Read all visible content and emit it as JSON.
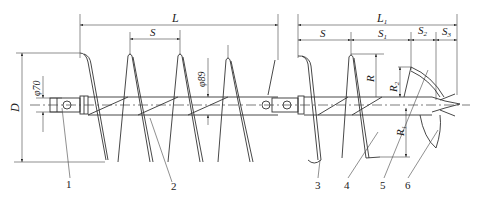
{
  "diagram": {
    "dimensions": {
      "L": "L",
      "L1": "L",
      "L1_sub": "1",
      "S": "S",
      "S_right": "S",
      "S1": "S",
      "S1_sub": "1",
      "S2": "S",
      "S2_sub": "2",
      "S3": "S",
      "S3_sub": "3",
      "D": "D",
      "R": "R",
      "R1": "R",
      "R1_sub": "1",
      "R2": "R",
      "R2_sub": "2",
      "phi70": "φ70",
      "phi89": "φ89"
    },
    "part_labels": [
      "1",
      "2",
      "3",
      "4",
      "5",
      "6"
    ]
  }
}
